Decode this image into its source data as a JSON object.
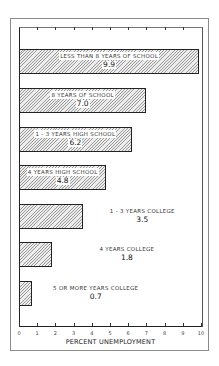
{
  "chart_data": {
    "type": "bar",
    "orientation": "horizontal",
    "title": "",
    "xlabel": "PERCENT UNEMPLOYMENT",
    "ylabel": "",
    "xlim": [
      0,
      10
    ],
    "xticks": [
      "0",
      "1",
      "2",
      "3",
      "4",
      "5",
      "6",
      "7",
      "8",
      "9",
      "10"
    ],
    "grid": false,
    "legend": null,
    "categories": [
      "LESS THAN 8 YEARS OF SCHOOL",
      "8 YEARS OF SCHOOL",
      "1 - 3 YEARS HIGH SCHOOL",
      "4 YEARS HIGH SCHOOL",
      "1 - 3 YEARS COLLEGE",
      "4 YEARS COLLEGE",
      "5 OR MORE YEARS COLLEGE"
    ],
    "values": [
      9.9,
      7.0,
      6.2,
      4.8,
      3.5,
      1.8,
      0.7
    ],
    "value_labels": [
      "9.9",
      "7.0",
      "6.2",
      "4.8",
      "3.5",
      "1.8",
      "0.7"
    ],
    "bar_fill": "diagonal-hatch",
    "colors": {
      "bar_border": "#222222",
      "hatch": "#9a9a9a",
      "background": "#ffffff"
    }
  }
}
